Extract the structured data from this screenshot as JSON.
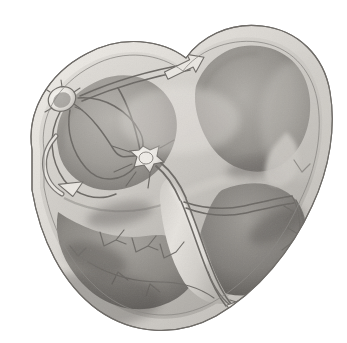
{
  "figure": {
    "subtitle": "Coronal four-chamber section of the heart",
    "view": "anterior coronal cut-away",
    "style": "grayscale airbrush medical illustration",
    "background_color": "#ffffff",
    "caption": ""
  },
  "palette": {
    "background": "#ffffff",
    "myocardium_light": "#d8d5d0",
    "myocardium_mid": "#a9a6a2",
    "myocardium_dark": "#6e6b68",
    "chamber_shadow": "#7c7976",
    "epicardium_rim": "#cfccc7",
    "septum_highlight": "#e7e4df",
    "conduction_line": "#6b6864",
    "conduction_line_light": "#8d8a86",
    "node_fill": "#f0ede8",
    "arrow_fill": "#e9e6e1",
    "arrow_stroke": "#707070",
    "outline": "#5d5a57"
  },
  "structures": [
    {
      "id": "sa-node",
      "name": "Sinoatrial (SA) node",
      "location": "upper right atrium, near superior vena cava",
      "x": 62,
      "y": 98,
      "shape": "oval nodule"
    },
    {
      "id": "av-node",
      "name": "Atrioventricular (AV) node",
      "location": "interatrial septum above tricuspid annulus",
      "x": 143,
      "y": 156,
      "shape": "stellate pale node"
    },
    {
      "id": "bundle-of-his",
      "name": "Bundle of His",
      "location": "membranous interventricular septum",
      "x": 172,
      "y": 190,
      "shape": "descending trunk"
    },
    {
      "id": "right-bundle",
      "name": "Right bundle branch",
      "location": "right side of interventricular septum",
      "x": 205,
      "y": 235,
      "shape": "branch"
    },
    {
      "id": "left-bundle",
      "name": "Left bundle branch",
      "location": "left side of interventricular septum",
      "x": 240,
      "y": 215,
      "shape": "branch fan"
    },
    {
      "id": "purkinje-rv",
      "name": "Purkinje fibers (right ventricle)",
      "location": "right ventricular endocardium",
      "x": 120,
      "y": 262,
      "shape": "arborizing fibers"
    },
    {
      "id": "purkinje-lv",
      "name": "Purkinje fibers (left ventricle)",
      "location": "left ventricular endocardium",
      "x": 292,
      "y": 240,
      "shape": "arborizing fibers"
    },
    {
      "id": "internodal-tracts",
      "name": "Internodal conduction tracts",
      "location": "right atrial wall between SA and AV node",
      "x": 100,
      "y": 130,
      "shape": "curving tracts"
    },
    {
      "id": "bachmann-bundle",
      "name": "Bachmann's bundle (interatrial tract)",
      "location": "roof of atria toward left atrium",
      "x": 175,
      "y": 62,
      "shape": "tract with arrowhead"
    },
    {
      "id": "right-atrium",
      "name": "Right atrium",
      "location": "upper left of image",
      "x": 95,
      "y": 150,
      "shape": "chamber"
    },
    {
      "id": "left-atrium",
      "name": "Left atrium",
      "location": "upper right of image",
      "x": 235,
      "y": 90,
      "shape": "chamber"
    },
    {
      "id": "right-ventricle",
      "name": "Right ventricle",
      "location": "lower left of image",
      "x": 120,
      "y": 265,
      "shape": "chamber"
    },
    {
      "id": "left-ventricle",
      "name": "Left ventricle",
      "location": "lower right of image",
      "x": 258,
      "y": 250,
      "shape": "chamber"
    },
    {
      "id": "septum",
      "name": "Interventricular septum",
      "location": "center of image",
      "x": 195,
      "y": 215,
      "shape": "muscular wall"
    }
  ],
  "arrows": [
    {
      "id": "arrow-bachmann",
      "name": "Impulse to left atrium",
      "direction": "up-right",
      "x": 196,
      "y": 60,
      "rotation": -28
    },
    {
      "id": "arrow-ra-loop",
      "name": "Impulse spread in right atrium",
      "direction": "clockwise-loop",
      "x": 72,
      "y": 180,
      "rotation": 0
    },
    {
      "id": "arrow-lv-apex",
      "name": "Purkinje conduction left ventricle apex",
      "direction": "left-down",
      "x": 306,
      "y": 265,
      "rotation": 150
    },
    {
      "id": "arrow-septal",
      "name": "Purkinje conduction septal apex",
      "direction": "down-left",
      "x": 247,
      "y": 312,
      "rotation": 200
    },
    {
      "id": "arrow-rv-apex",
      "name": "Purkinje conduction right ventricle apex",
      "direction": "down",
      "x": 284,
      "y": 300,
      "rotation": 190
    }
  ]
}
